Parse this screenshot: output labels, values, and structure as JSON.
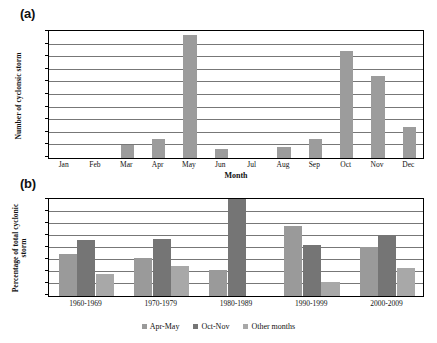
{
  "figure": {
    "panel_a_label": "(a)",
    "panel_b_label": "(b)"
  },
  "colors": {
    "apr_may": "#9a9a9a",
    "oct_nov": "#757575",
    "other_months": "#a8a8a8",
    "bar_monthly": "#9c9c9c",
    "axis": "#000000",
    "gridline": "#777777",
    "background": "#ffffff"
  },
  "chart_data": [
    {
      "id": "panel-a",
      "type": "bar",
      "title": "",
      "panel": "(a)",
      "xlabel": "Month",
      "ylabel": "Number of cyclonsic storm",
      "ylim": [
        0,
        20
      ],
      "ytick_step": 2,
      "yticks": [
        "0",
        "2",
        "4",
        "6",
        "8",
        "10",
        "12",
        "14",
        "16",
        "18",
        "20"
      ],
      "grid": true,
      "legend": "none",
      "categories": [
        "Jan",
        "Feb",
        "Mar",
        "Apr",
        "May",
        "Jun",
        "Jul",
        "Aug",
        "Sep",
        "Oct",
        "Nov",
        "Dec"
      ],
      "values": [
        0,
        0,
        2,
        3,
        19.5,
        1.5,
        0,
        1.7,
        3,
        17,
        13,
        5
      ]
    },
    {
      "id": "panel-b",
      "type": "bar",
      "title": "",
      "panel": "(b)",
      "xlabel": "",
      "ylabel": "Percentage of total cyclonic storm",
      "ylim": [
        0,
        80
      ],
      "ytick_step": 10,
      "yticks": [
        "0",
        "10",
        "20",
        "30",
        "40",
        "50",
        "60",
        "70",
        "80"
      ],
      "grid": true,
      "legend": "bottom-center",
      "categories": [
        "1960-1969",
        "1970-1979",
        "1980-1989",
        "1990-1999",
        "2000-2009"
      ],
      "series": [
        {
          "name": "Apr-May",
          "values": [
            35,
            32,
            22,
            58,
            41
          ]
        },
        {
          "name": "Oct-Nov",
          "values": [
            47,
            47.5,
            82,
            42.5,
            50.5
          ]
        },
        {
          "name": "Other months",
          "values": [
            18,
            25,
            0,
            11.5,
            23.5
          ]
        }
      ]
    }
  ],
  "legend_items": [
    {
      "label": "Apr-May"
    },
    {
      "label": "Oct-Nov"
    },
    {
      "label": "Other months"
    }
  ]
}
